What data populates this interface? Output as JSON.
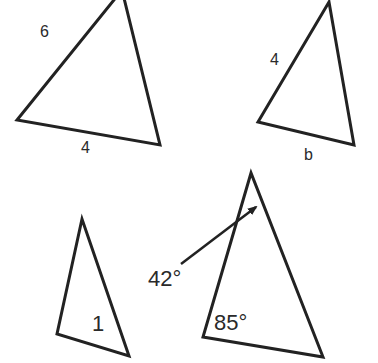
{
  "diagram": {
    "title": "",
    "stroke_color": "#222222",
    "background": "#ffffff",
    "triangles": [
      {
        "id": "triangle-top-left",
        "vertices": [
          [
            122,
            -10
          ],
          [
            17,
            120
          ],
          [
            160,
            145
          ]
        ],
        "labels": [
          {
            "text": "6",
            "target": "left side"
          },
          {
            "text": "4",
            "target": "bottom side"
          }
        ]
      },
      {
        "id": "triangle-top-right",
        "vertices": [
          [
            329,
            2
          ],
          [
            258,
            122
          ],
          [
            354,
            145
          ]
        ],
        "labels": [
          {
            "text": "4",
            "target": "left side"
          },
          {
            "text": "b",
            "target": "bottom side"
          }
        ]
      },
      {
        "id": "triangle-bottom-left",
        "vertices": [
          [
            82,
            219
          ],
          [
            57,
            334
          ],
          [
            129,
            356
          ]
        ],
        "labels": [
          {
            "text": "1",
            "target": "interior"
          }
        ]
      },
      {
        "id": "triangle-bottom-right",
        "vertices": [
          [
            251,
            173
          ],
          [
            203,
            337
          ],
          [
            323,
            357
          ]
        ],
        "labels": [
          {
            "text": "42°",
            "target": "apex angle (via arrow)"
          },
          {
            "text": "85°",
            "target": "bottom-left angle"
          }
        ]
      }
    ],
    "labels": {
      "t1_side_left": "6",
      "t1_side_bottom": "4",
      "t2_side_left": "4",
      "t2_side_bottom": "b",
      "t3_inner": "1",
      "t4_angle_apex": "42°",
      "t4_angle_bottom_left": "85°"
    }
  }
}
